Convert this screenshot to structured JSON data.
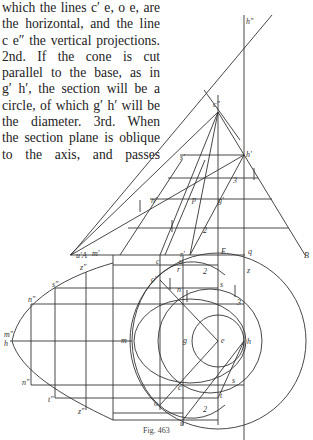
{
  "page": {
    "text_lines": [
      "which the lines c′ e, o e, are",
      "the horizontal, and the line",
      "c e″ the vertical projections.",
      "2nd. If the cone is cut",
      "parallel to the base, as in",
      "g′ h′, the section will be a",
      "circle, of which g′ h′ will be",
      "the diameter. 3rd. When",
      "the section plane is oblique",
      "to the axis, and passes"
    ],
    "caption": "Fig. 463"
  },
  "figure": {
    "labels": {
      "h_dd": "h″",
      "c_dd": "c″",
      "h_d": "h′",
      "s_d": "s′",
      "three_top": "3",
      "n_d": "n′",
      "p": "p",
      "g_d": "g′",
      "two_top": "2",
      "m_d": "m′",
      "r_d": "r′",
      "A": "A",
      "u_d": "u′",
      "c": "c",
      "E": "E",
      "q": "q",
      "B": "B",
      "u_top": "u",
      "r": "r",
      "two_plan": "2",
      "z": "z",
      "c_d_plan": "c′",
      "n": "n",
      "s": "s",
      "three_plan": "3",
      "m": "m",
      "g": "g",
      "e": "e",
      "h": "h",
      "s_low": "s",
      "c_low": "c",
      "t": "t",
      "o": "o",
      "two_low": "2",
      "u_low": "u",
      "z_dd": "z″",
      "s_dd": "s″",
      "n_dd_upper": "n″",
      "m_dd": "m″",
      "h_dd_left": "h",
      "n_dd_lower": "n″",
      "t_dd": "t″",
      "z_dd_low": "z″"
    }
  }
}
